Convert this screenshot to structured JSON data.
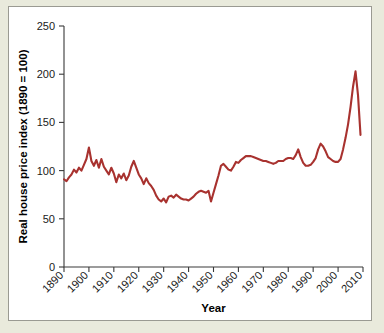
{
  "figure": {
    "background_color": "#e9eadc",
    "card_color": "#ffffff",
    "border_color": "#9a9a92"
  },
  "chart_data": {
    "type": "line",
    "title": "",
    "subtitle": "",
    "xlabel": "Year",
    "ylabel": "Real house price index (1890 = 100)",
    "xlim": [
      1890,
      2010
    ],
    "ylim": [
      0,
      250
    ],
    "xticks": [
      1890,
      1900,
      1910,
      1920,
      1930,
      1940,
      1950,
      1960,
      1970,
      1980,
      1990,
      2000,
      2010
    ],
    "xtick_labels": [
      "1890",
      "1900",
      "1910",
      "1920",
      "1930",
      "1940",
      "1950",
      "1960",
      "1970",
      "1980",
      "1990",
      "2000",
      "2010"
    ],
    "xtick_label_rotation": -45,
    "yticks": [
      0,
      50,
      100,
      150,
      200,
      250
    ],
    "ytick_labels": [
      "0",
      "50",
      "100",
      "150",
      "200",
      "250"
    ],
    "grid": false,
    "legend": false,
    "legend_position": "none",
    "series": [
      {
        "name": "Real house price index",
        "color": "#a8322f",
        "line_width": 2.1,
        "x": [
          1890,
          1891,
          1892,
          1893,
          1894,
          1895,
          1896,
          1897,
          1898,
          1899,
          1900,
          1901,
          1902,
          1903,
          1904,
          1905,
          1906,
          1907,
          1908,
          1909,
          1910,
          1911,
          1912,
          1913,
          1914,
          1915,
          1916,
          1917,
          1918,
          1919,
          1920,
          1921,
          1922,
          1923,
          1924,
          1925,
          1926,
          1927,
          1928,
          1929,
          1930,
          1931,
          1932,
          1933,
          1934,
          1935,
          1936,
          1937,
          1938,
          1939,
          1940,
          1941,
          1942,
          1943,
          1944,
          1945,
          1946,
          1947,
          1948,
          1949,
          1950,
          1951,
          1952,
          1953,
          1954,
          1955,
          1956,
          1957,
          1958,
          1959,
          1960,
          1961,
          1962,
          1963,
          1964,
          1965,
          1966,
          1967,
          1968,
          1969,
          1970,
          1971,
          1972,
          1973,
          1974,
          1975,
          1976,
          1977,
          1978,
          1979,
          1980,
          1981,
          1982,
          1983,
          1984,
          1985,
          1986,
          1987,
          1988,
          1989,
          1990,
          1991,
          1992,
          1993,
          1994,
          1995,
          1996,
          1997,
          1998,
          1999,
          2000,
          2001,
          2002,
          2003,
          2004,
          2005,
          2006,
          2007,
          2008,
          2009
        ],
        "values": [
          91,
          89,
          93,
          96,
          101,
          98,
          103,
          100,
          106,
          112,
          124,
          110,
          105,
          111,
          103,
          112,
          104,
          100,
          96,
          103,
          97,
          88,
          96,
          92,
          97,
          90,
          95,
          104,
          110,
          103,
          96,
          92,
          86,
          92,
          87,
          84,
          80,
          74,
          70,
          68,
          71,
          67,
          73,
          74,
          72,
          75,
          73,
          71,
          70,
          70,
          69,
          71,
          73,
          76,
          78,
          79,
          78,
          77,
          79,
          68,
          77,
          86,
          95,
          105,
          107,
          104,
          101,
          100,
          104,
          109,
          108,
          111,
          113,
          115,
          115,
          115,
          114,
          113,
          112,
          111,
          110,
          110,
          109,
          108,
          107,
          108,
          110,
          110,
          110,
          112,
          113,
          113,
          112,
          116,
          122,
          114,
          108,
          105,
          105,
          106,
          109,
          113,
          122,
          128,
          125,
          120,
          114,
          112,
          110,
          109,
          109,
          112,
          122,
          134,
          148,
          166,
          187,
          203,
          178,
          137
        ]
      }
    ],
    "annotations": [],
    "notable_points": [
      {
        "label": "peak",
        "x": 2007,
        "y": 203
      },
      {
        "label": "trough",
        "x": 1932,
        "y": 67
      },
      {
        "label": "last",
        "x": 2009,
        "y": 137
      }
    ]
  }
}
